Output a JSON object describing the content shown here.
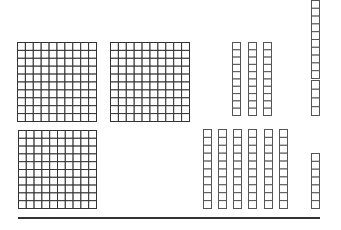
{
  "diagram": {
    "colors": {
      "stroke": "#555555",
      "grid": "#333333",
      "background": "#ffffff",
      "baseline": "#333333"
    },
    "hundreds": [
      {
        "x": 17,
        "y": 42,
        "size": 79,
        "rows": 10,
        "cols": 10
      },
      {
        "x": 110,
        "y": 42,
        "size": 79,
        "rows": 10,
        "cols": 10
      },
      {
        "x": 18,
        "y": 130,
        "size": 78,
        "rows": 10,
        "cols": 10
      }
    ],
    "tens": [
      {
        "x": 232,
        "y": 42,
        "w": 8,
        "h": 73,
        "cells": 10
      },
      {
        "x": 248,
        "y": 42,
        "w": 8,
        "h": 73,
        "cells": 10
      },
      {
        "x": 263,
        "y": 42,
        "w": 8,
        "h": 73,
        "cells": 10
      },
      {
        "x": 311,
        "y": 0,
        "w": 8,
        "h": 78,
        "cells": 10
      },
      {
        "x": 203,
        "y": 129,
        "w": 8,
        "h": 79,
        "cells": 10
      },
      {
        "x": 218,
        "y": 129,
        "w": 8,
        "h": 79,
        "cells": 10
      },
      {
        "x": 233,
        "y": 129,
        "w": 8,
        "h": 79,
        "cells": 10
      },
      {
        "x": 248,
        "y": 129,
        "w": 8,
        "h": 79,
        "cells": 10
      },
      {
        "x": 264,
        "y": 129,
        "w": 8,
        "h": 79,
        "cells": 10
      },
      {
        "x": 279,
        "y": 129,
        "w": 8,
        "h": 79,
        "cells": 10
      }
    ],
    "ones": [
      {
        "x": 311,
        "y": 80,
        "w": 8,
        "h": 35,
        "cells": 4
      },
      {
        "x": 311,
        "y": 153,
        "w": 8,
        "h": 55,
        "cells": 7
      }
    ],
    "baseline": {
      "x1": 18,
      "x2": 320,
      "y": 218
    }
  }
}
